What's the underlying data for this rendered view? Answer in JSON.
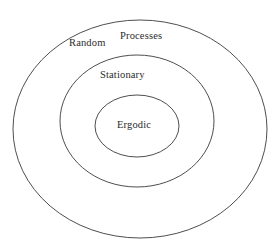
{
  "diagram": {
    "type": "nested-venn-ellipses",
    "background_color": "#ffffff",
    "stroke_color": "#3a3a3a",
    "text_color": "#2b2b2b",
    "labels": {
      "outer_left": "Random",
      "outer_right": "Processes",
      "middle": "Stationary",
      "inner": "Ergodic"
    },
    "ellipses": [
      {
        "name": "random-processes",
        "cx": 140,
        "cy": 129,
        "rx": 127,
        "ry": 109
      },
      {
        "name": "stationary",
        "cx": 137,
        "cy": 121,
        "rx": 77,
        "ry": 66
      },
      {
        "name": "ergodic",
        "cx": 137,
        "cy": 126,
        "rx": 42,
        "ry": 31
      }
    ]
  }
}
